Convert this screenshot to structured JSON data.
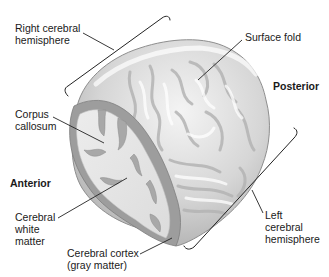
{
  "figure": {
    "labels": {
      "right_hemisphere": [
        "Right cerebral",
        "hemisphere"
      ],
      "surface_fold": "Surface fold",
      "posterior": "Posterior",
      "corpus_callosum": [
        "Corpus",
        "callosum"
      ],
      "anterior": "Anterior",
      "white_matter": [
        "Cerebral",
        "white",
        "matter"
      ],
      "cortex": [
        "Cerebral cortex",
        "(gray matter)"
      ],
      "left_hemisphere": [
        "Left",
        "cerebral",
        "hemisphere"
      ]
    },
    "colors": {
      "background": "#ffffff",
      "brain_surface": "#d9d9d9",
      "brain_highlight": "#f2f2f2",
      "gray_matter": "#9c9c9c",
      "white_matter": "#e6e6e6",
      "leader_line": "#222222",
      "text": "#1a1a1a"
    }
  }
}
